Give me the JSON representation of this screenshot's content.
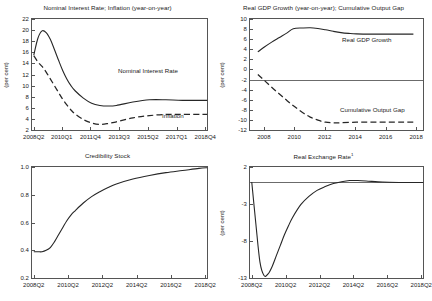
{
  "figure": {
    "panel_count": 4,
    "background": "#ffffff",
    "line_color": "#262626",
    "axis_color": "#555555"
  },
  "chart_data": [
    {
      "id": "nominal-interest-inflation",
      "type": "line",
      "title": "Nominal Interest Rate; Inflation (year-on-year)",
      "xlabel": "",
      "ylabel": "(per cent)",
      "ylim": [
        2,
        22
      ],
      "yticks": [
        "2",
        "4",
        "6",
        "8",
        "10",
        "12",
        "14",
        "16",
        "18",
        "20",
        "22"
      ],
      "xticks": [
        "2008Q2",
        "2010Q1",
        "2011Q4",
        "2013Q3",
        "2015Q2",
        "2017Q1",
        "2018Q4"
      ],
      "grid": false,
      "legend_position": "in-plot",
      "series": [
        {
          "name": "Nominal Interest Rate",
          "style": "solid",
          "x": [
            0,
            1,
            2,
            3,
            4,
            5,
            6,
            7,
            8,
            9,
            10,
            12,
            14,
            16,
            18,
            20,
            24,
            28,
            32,
            36,
            42
          ],
          "values": [
            15.6,
            18.6,
            19.9,
            19.6,
            18.4,
            16.6,
            14.7,
            12.9,
            11.4,
            10.2,
            9.3,
            8.0,
            7.1,
            6.7,
            6.6,
            6.7,
            7.3,
            7.7,
            7.7,
            7.6,
            7.6
          ]
        },
        {
          "name": "Inflation",
          "style": "dashed",
          "x": [
            0,
            1,
            2,
            3,
            4,
            5,
            6,
            7,
            8,
            9,
            10,
            12,
            14,
            16,
            18,
            20,
            24,
            28,
            32,
            36,
            42
          ],
          "values": [
            15.5,
            14.4,
            13.6,
            12.6,
            11.4,
            10.2,
            9.0,
            7.8,
            6.8,
            5.9,
            5.2,
            4.2,
            3.6,
            3.35,
            3.5,
            3.8,
            4.5,
            4.9,
            5.1,
            5.1,
            5.1
          ]
        }
      ]
    },
    {
      "id": "gdp-growth-output-gap",
      "type": "line",
      "title": "Real GDP Growth (year-on-year); Cumulative Output Gap",
      "xlabel": "",
      "ylabel": "(per cent)",
      "ylim": [
        -12,
        10
      ],
      "yticks": [
        "-12",
        "-10",
        "-8",
        "-6",
        "-4",
        "-2",
        "0",
        "2",
        "4",
        "6",
        "8",
        "10"
      ],
      "xticks": [
        "2008",
        "2010",
        "2012",
        "2014",
        "2016",
        "2018"
      ],
      "grid": false,
      "zero_line": true,
      "legend_position": "in-plot",
      "series": [
        {
          "name": "Real GDP Growth",
          "style": "solid",
          "x": [
            2007.6,
            2008,
            2008.5,
            2009,
            2009.5,
            2009.9,
            2010.5,
            2011,
            2011.5,
            2012,
            2012.5,
            2013,
            2013.5,
            2014,
            2015,
            2016,
            2017,
            2017.7
          ],
          "values": [
            3.6,
            4.5,
            5.5,
            6.4,
            7.3,
            8.1,
            8.25,
            8.3,
            8.15,
            7.9,
            7.6,
            7.35,
            7.2,
            7.1,
            7.05,
            7.05,
            7.05,
            7.05
          ]
        },
        {
          "name": "Cumulative Output Gap",
          "style": "dashed",
          "x": [
            2007.6,
            2008,
            2008.5,
            2009,
            2009.5,
            2010,
            2010.5,
            2011,
            2011.5,
            2012,
            2012.5,
            2013,
            2014,
            2015,
            2016,
            2017,
            2017.7
          ],
          "values": [
            -0.8,
            -1.9,
            -3.3,
            -4.6,
            -5.9,
            -7.1,
            -8.2,
            -9.1,
            -9.7,
            -10.1,
            -10.2,
            -10.2,
            -10.1,
            -10.1,
            -10.1,
            -10.1,
            -10.1
          ]
        }
      ]
    },
    {
      "id": "credibility-stock",
      "type": "line",
      "title": "Credibility Stock",
      "xlabel": "",
      "ylabel": "",
      "ylim": [
        0.2,
        1.0
      ],
      "yticks": [
        "0.2",
        "0.4",
        "0.6",
        "0.8",
        "1.0"
      ],
      "xticks": [
        "2008Q2",
        "2010Q2",
        "2012Q2",
        "2014Q2",
        "2016Q2",
        "2018Q2"
      ],
      "grid": false,
      "series": [
        {
          "name": "Credibility Stock",
          "style": "solid",
          "x": [
            0,
            1,
            2,
            3,
            4,
            5,
            6,
            7,
            8,
            9,
            10,
            12,
            14,
            16,
            18,
            20,
            24,
            28,
            32,
            36,
            40,
            42
          ],
          "values": [
            0.4,
            0.4,
            0.4,
            0.41,
            0.43,
            0.47,
            0.52,
            0.57,
            0.62,
            0.66,
            0.69,
            0.745,
            0.79,
            0.825,
            0.855,
            0.88,
            0.915,
            0.94,
            0.96,
            0.975,
            0.99,
            0.995
          ]
        }
      ]
    },
    {
      "id": "real-exchange-rate",
      "type": "line",
      "title": "Real Exchange Rate",
      "title_footnote": "1",
      "xlabel": "",
      "ylabel": "(per cent)",
      "ylim": [
        -13,
        2
      ],
      "yticks": [
        "-13",
        "-8",
        "-3",
        "2"
      ],
      "xticks": [
        "2008Q2",
        "2010Q2",
        "2012Q2",
        "2014Q2",
        "2016Q2",
        "2018Q2"
      ],
      "grid": false,
      "zero_line": true,
      "series": [
        {
          "name": "Real Exchange Rate",
          "style": "solid",
          "x": [
            0,
            1,
            2,
            3,
            4,
            5,
            6,
            7,
            8,
            9,
            10,
            12,
            14,
            16,
            18,
            20,
            22,
            24,
            26,
            28,
            32,
            36,
            40,
            42
          ],
          "values": [
            0.0,
            -5.5,
            -10.6,
            -12.4,
            -12.2,
            -11.2,
            -9.8,
            -8.4,
            -7.0,
            -5.8,
            -4.7,
            -3.0,
            -1.9,
            -1.1,
            -0.6,
            -0.2,
            0.05,
            0.2,
            0.2,
            0.15,
            0.0,
            -0.05,
            -0.05,
            -0.05
          ]
        }
      ]
    }
  ]
}
